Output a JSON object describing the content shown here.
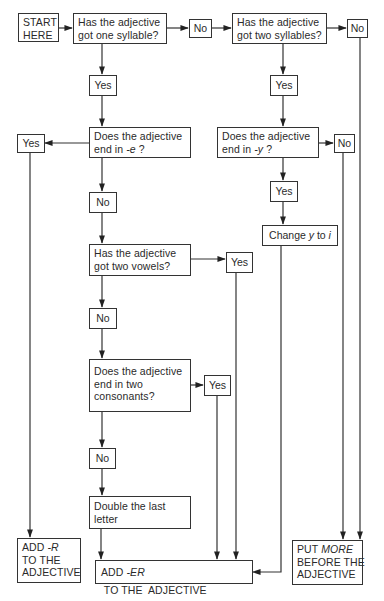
{
  "diagram": {
    "type": "flowchart",
    "topic": "Forming comparative adjectives",
    "start": {
      "lines": [
        "START",
        "HERE"
      ]
    },
    "questions": {
      "one_syllable": {
        "lines": [
          "Has the adjective",
          "got one syllable?"
        ]
      },
      "two_syllables": {
        "lines": [
          "Has the adjective",
          "got two syllables?"
        ]
      },
      "end_in_e": {
        "line1": "Does the adjective",
        "line2_prefix": "end in ",
        "line2_italic": "-e",
        "line2_suffix": " ?"
      },
      "end_in_y": {
        "line1": "Does the adjective",
        "line2_prefix": "end in ",
        "line2_italic": "-y",
        "line2_suffix": " ?"
      },
      "two_vowels": {
        "lines": [
          "Has the adjective",
          "got two vowels?"
        ]
      },
      "two_consonants": {
        "lines": [
          "Does the adjective",
          "end in two",
          "consonants?"
        ]
      }
    },
    "answers": {
      "yes": "Yes",
      "no": "No"
    },
    "actions": {
      "change_y": {
        "prefix": "Change ",
        "italic1": "y",
        "middle": " to ",
        "italic2": "i"
      },
      "double_letter": {
        "lines": [
          "Double the last",
          "letter"
        ]
      }
    },
    "results": {
      "add_r": {
        "prefix": "ADD ",
        "italic": "-R",
        "lines": [
          "TO THE",
          "ADJECTIVE"
        ]
      },
      "add_er": {
        "prefix": "ADD ",
        "italic": "-ER",
        "suffix": " TO THE  ADJECTIVE"
      },
      "put_more": {
        "prefix": "PUT ",
        "italic": "MORE",
        "lines": [
          "BEFORE THE",
          "ADJECTIVE"
        ]
      }
    },
    "colors": {
      "line": "#333333",
      "background": "#ffffff",
      "text": "#2a2a2a"
    }
  }
}
